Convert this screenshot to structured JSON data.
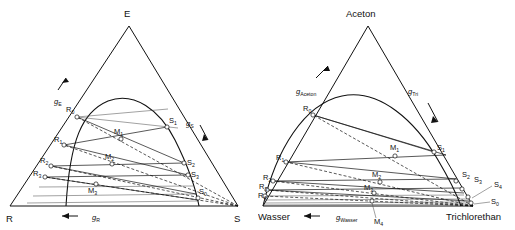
{
  "figure": {
    "kind": "two ternary phase diagrams with binodal curve, tie lines and construction rays",
    "panels": [
      {
        "id": "left",
        "name": "generic-ternary-diagram",
        "vertices": {
          "top": "E",
          "bottom_left": "R",
          "bottom_right": "S"
        },
        "axis_labels": [
          {
            "name": "g-E",
            "base": "g",
            "sub": "E"
          },
          {
            "name": "g-S",
            "base": "g",
            "sub": "S"
          },
          {
            "name": "g-R",
            "base": "g",
            "sub": "R"
          }
        ],
        "raffinate_points": [
          {
            "base": "R",
            "sub": "0"
          },
          {
            "base": "R",
            "sub": "1"
          },
          {
            "base": "R",
            "sub": "2"
          },
          {
            "base": "R",
            "sub": "3"
          }
        ],
        "mixture_points": [
          {
            "base": "M",
            "sub": "1"
          },
          {
            "base": "M",
            "sub": "2"
          },
          {
            "base": "M",
            "sub": "3"
          }
        ],
        "extract_points": [
          {
            "base": "S",
            "sub": "1"
          },
          {
            "base": "S",
            "sub": "2"
          },
          {
            "base": "S",
            "sub": "3"
          },
          {
            "base": "S",
            "sub": "0"
          }
        ]
      },
      {
        "id": "right",
        "name": "aceton-wasser-trichlorethan-diagram",
        "vertices": {
          "top": "Aceton",
          "bottom_left": "Wasser",
          "bottom_right": "Trichlorethan"
        },
        "axis_labels": [
          {
            "name": "g-Aceton",
            "base": "g",
            "sub": "Aceton"
          },
          {
            "name": "g-Tri",
            "base": "g",
            "sub": "Tri"
          },
          {
            "name": "g-Wasser",
            "base": "g",
            "sub": "Wasser"
          }
        ],
        "raffinate_points": [
          {
            "base": "R",
            "sub": "0"
          },
          {
            "base": "R",
            "sub": "1"
          },
          {
            "base": "R",
            "sub": "2"
          },
          {
            "base": "R",
            "sub": "3"
          },
          {
            "base": "R",
            "sub": "4"
          }
        ],
        "mixture_points": [
          {
            "base": "M",
            "sub": "1"
          },
          {
            "base": "M",
            "sub": "2"
          },
          {
            "base": "M",
            "sub": "3"
          },
          {
            "base": "M",
            "sub": "4"
          }
        ],
        "extract_points": [
          {
            "base": "S",
            "sub": "1"
          },
          {
            "base": "S",
            "sub": "2"
          },
          {
            "base": "S",
            "sub": "3"
          },
          {
            "base": "S",
            "sub": "4"
          },
          {
            "base": "S",
            "sub": "0"
          }
        ]
      }
    ]
  },
  "colors": {
    "ink": "#111111",
    "paper": "#ffffff"
  }
}
